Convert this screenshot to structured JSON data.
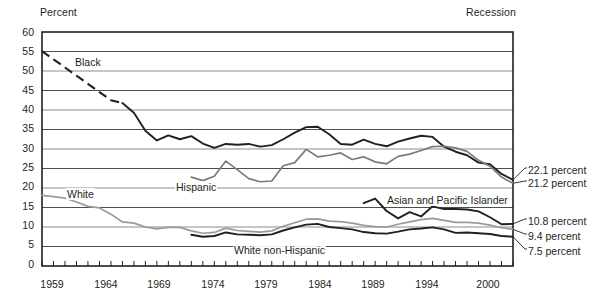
{
  "chart_data": {
    "type": "line",
    "title": "",
    "ylabel": "Percent",
    "xlabel": "",
    "ylim": [
      0,
      60
    ],
    "xlim": [
      1959,
      2000
    ],
    "ytick_labels": [
      "60",
      "55",
      "50",
      "45",
      "40",
      "35",
      "30",
      "25",
      "20",
      "15",
      "10",
      "5",
      "0"
    ],
    "ytick_values": [
      60,
      55,
      50,
      45,
      40,
      35,
      30,
      25,
      20,
      15,
      10,
      5,
      0
    ],
    "xtick_labels": [
      "1959",
      "1964",
      "1969",
      "1974",
      "1979",
      "1984",
      "1989",
      "1994",
      "2000"
    ],
    "xtick_values": [
      1959,
      1964,
      1969,
      1974,
      1979,
      1984,
      1989,
      1994,
      2000
    ],
    "grid": true,
    "legend_position": "inline-annotations",
    "recession_note": "Recession",
    "series": [
      {
        "name": "Black",
        "label": "Black",
        "color": "#231f20",
        "dashed_until": 1966,
        "end_value_label": "22.1 percent",
        "x": [
          1959,
          1960,
          1961,
          1962,
          1963,
          1964,
          1965,
          1966,
          1967,
          1968,
          1969,
          1970,
          1971,
          1972,
          1973,
          1974,
          1975,
          1976,
          1977,
          1978,
          1979,
          1980,
          1981,
          1982,
          1983,
          1984,
          1985,
          1986,
          1987,
          1988,
          1989,
          1990,
          1991,
          1992,
          1993,
          1994,
          1995,
          1996,
          1997,
          1998,
          1999,
          2000
        ],
        "values": [
          55.1,
          53.0,
          50.9,
          48.8,
          46.7,
          44.6,
          42.5,
          41.8,
          39.3,
          34.7,
          32.2,
          33.5,
          32.5,
          33.3,
          31.4,
          30.3,
          31.3,
          31.1,
          31.3,
          30.6,
          31.0,
          32.5,
          34.2,
          35.6,
          35.7,
          33.8,
          31.3,
          31.1,
          32.4,
          31.3,
          30.7,
          31.9,
          32.7,
          33.4,
          33.1,
          30.6,
          29.3,
          28.4,
          26.5,
          26.1,
          23.6,
          22.1
        ]
      },
      {
        "name": "Hispanic",
        "label": "Hispanic",
        "color": "#7b7b7b",
        "end_value_label": "21.2 percent",
        "x": [
          1972,
          1973,
          1974,
          1975,
          1976,
          1977,
          1978,
          1979,
          1980,
          1981,
          1982,
          1983,
          1984,
          1985,
          1986,
          1987,
          1988,
          1989,
          1990,
          1991,
          1992,
          1993,
          1994,
          1995,
          1996,
          1997,
          1998,
          1999,
          2000
        ],
        "values": [
          22.8,
          21.9,
          23.0,
          26.9,
          24.7,
          22.4,
          21.6,
          21.8,
          25.7,
          26.5,
          29.9,
          28.0,
          28.4,
          29.0,
          27.3,
          28.0,
          26.7,
          26.2,
          28.1,
          28.7,
          29.6,
          30.6,
          30.7,
          30.3,
          29.4,
          27.1,
          25.6,
          22.8,
          21.2
        ]
      },
      {
        "name": "White",
        "label": "White",
        "color": "#9a9a9a",
        "end_value_label": "9.4 percent",
        "x": [
          1959,
          1960,
          1961,
          1962,
          1963,
          1964,
          1965,
          1966,
          1967,
          1968,
          1969,
          1970,
          1971,
          1972,
          1973,
          1974,
          1975,
          1976,
          1977,
          1978,
          1979,
          1980,
          1981,
          1982,
          1983,
          1984,
          1985,
          1986,
          1987,
          1988,
          1989,
          1990,
          1991,
          1992,
          1993,
          1994,
          1995,
          1996,
          1997,
          1998,
          1999,
          2000
        ],
        "values": [
          18.1,
          17.8,
          17.4,
          16.4,
          15.3,
          14.9,
          13.3,
          11.3,
          11.0,
          10.0,
          9.5,
          9.9,
          9.9,
          9.0,
          8.4,
          8.6,
          9.7,
          9.1,
          8.9,
          8.7,
          9.0,
          10.2,
          11.1,
          12.0,
          12.1,
          11.5,
          11.4,
          11.0,
          10.4,
          10.1,
          10.0,
          10.7,
          11.3,
          11.9,
          12.2,
          11.7,
          11.2,
          11.2,
          11.0,
          10.5,
          9.8,
          9.4
        ]
      },
      {
        "name": "White non-Hispanic",
        "label": "White non-Hispanic",
        "color": "#231f20",
        "end_value_label": "7.5 percent",
        "x": [
          1972,
          1973,
          1974,
          1975,
          1976,
          1977,
          1978,
          1979,
          1980,
          1981,
          1982,
          1983,
          1984,
          1985,
          1986,
          1987,
          1988,
          1989,
          1990,
          1991,
          1992,
          1993,
          1994,
          1995,
          1996,
          1997,
          1998,
          1999,
          2000
        ],
        "values": [
          8.0,
          7.5,
          7.7,
          8.6,
          8.1,
          8.0,
          7.9,
          8.1,
          9.1,
          9.9,
          10.6,
          10.8,
          10.0,
          9.7,
          9.4,
          8.7,
          8.4,
          8.3,
          8.8,
          9.4,
          9.6,
          9.9,
          9.4,
          8.5,
          8.6,
          8.4,
          8.2,
          7.7,
          7.5
        ]
      },
      {
        "name": "Asian and Pacific Islander",
        "label": "Asian and Pacific Islander",
        "color": "#231f20",
        "end_value_label": "10.8 percent",
        "x": [
          1987,
          1988,
          1989,
          1990,
          1991,
          1992,
          1993,
          1994,
          1995,
          1996,
          1997,
          1998,
          1999,
          2000
        ],
        "values": [
          16.1,
          17.3,
          14.1,
          12.2,
          13.8,
          12.7,
          15.3,
          14.6,
          14.6,
          14.5,
          14.0,
          12.5,
          10.7,
          10.8
        ]
      }
    ],
    "end_labels": [
      {
        "text": "22.1 percent",
        "series": "Black"
      },
      {
        "text": "21.2 percent",
        "series": "Hispanic"
      },
      {
        "text": "10.8 percent",
        "series": "Asian and Pacific Islander"
      },
      {
        "text": "9.4 percent",
        "series": "White"
      },
      {
        "text": "7.5 percent",
        "series": "White non-Hispanic"
      }
    ]
  }
}
